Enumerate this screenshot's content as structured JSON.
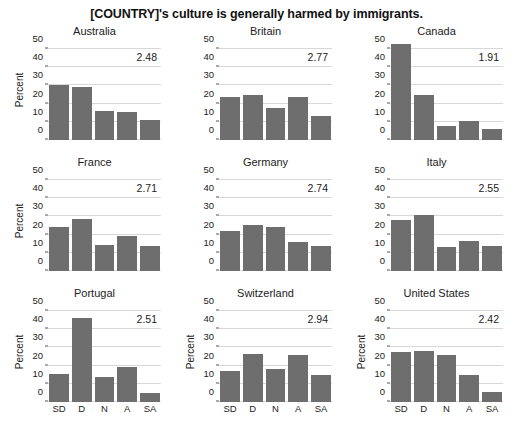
{
  "chart_data": {
    "type": "bar",
    "title": "[COUNTRY]'s culture is generally harmed by immigrants.",
    "xlabel": "",
    "ylabel": "Percent",
    "categories": [
      "SD",
      "D",
      "N",
      "A",
      "SA"
    ],
    "ylim": [
      0,
      55
    ],
    "yticks": [
      0,
      10,
      20,
      30,
      40,
      50
    ],
    "grid": true,
    "legend": null,
    "bar_color": "#6e6e6e",
    "layout": {
      "rows": 3,
      "cols": 3
    },
    "panels": [
      {
        "title": "Australia",
        "values": [
          30.0,
          29.0,
          16.0,
          15.5,
          11.0
        ],
        "annotation": "2.48",
        "ylabel": "Percent",
        "show_ylabel": true,
        "show_xticks": false
      },
      {
        "title": "Britain",
        "values": [
          23.5,
          25.0,
          17.5,
          23.5,
          13.0
        ],
        "annotation": "2.77",
        "ylabel": "Percent",
        "show_ylabel": false,
        "show_xticks": false
      },
      {
        "title": "Canada",
        "values": [
          53.0,
          25.0,
          7.5,
          10.5,
          6.0
        ],
        "annotation": "1.91",
        "ylabel": "Percent",
        "show_ylabel": false,
        "show_xticks": false
      },
      {
        "title": "France",
        "values": [
          24.0,
          28.5,
          14.5,
          19.0,
          14.0
        ],
        "annotation": "2.71",
        "ylabel": "Percent",
        "show_ylabel": true,
        "show_xticks": false
      },
      {
        "title": "Germany",
        "values": [
          22.0,
          25.5,
          24.0,
          16.0,
          14.0
        ],
        "annotation": "2.74",
        "ylabel": "Percent",
        "show_ylabel": false,
        "show_xticks": false
      },
      {
        "title": "Italy",
        "values": [
          28.0,
          31.0,
          13.0,
          16.5,
          13.5
        ],
        "annotation": "2.55",
        "ylabel": "Percent",
        "show_ylabel": false,
        "show_xticks": false
      },
      {
        "title": "Portugal",
        "values": [
          15.5,
          46.0,
          13.5,
          19.5,
          5.0
        ],
        "annotation": "2.51",
        "ylabel": "Percent",
        "show_ylabel": true,
        "show_xticks": true
      },
      {
        "title": "Switzerland",
        "values": [
          17.0,
          26.5,
          18.0,
          26.0,
          15.0
        ],
        "annotation": "2.94",
        "ylabel": "Percent",
        "show_ylabel": true,
        "show_xticks": true
      },
      {
        "title": "United States",
        "values": [
          27.5,
          28.0,
          26.0,
          15.0,
          5.5
        ],
        "annotation": "2.42",
        "ylabel": "Percent",
        "show_ylabel": true,
        "show_xticks": true
      }
    ]
  }
}
